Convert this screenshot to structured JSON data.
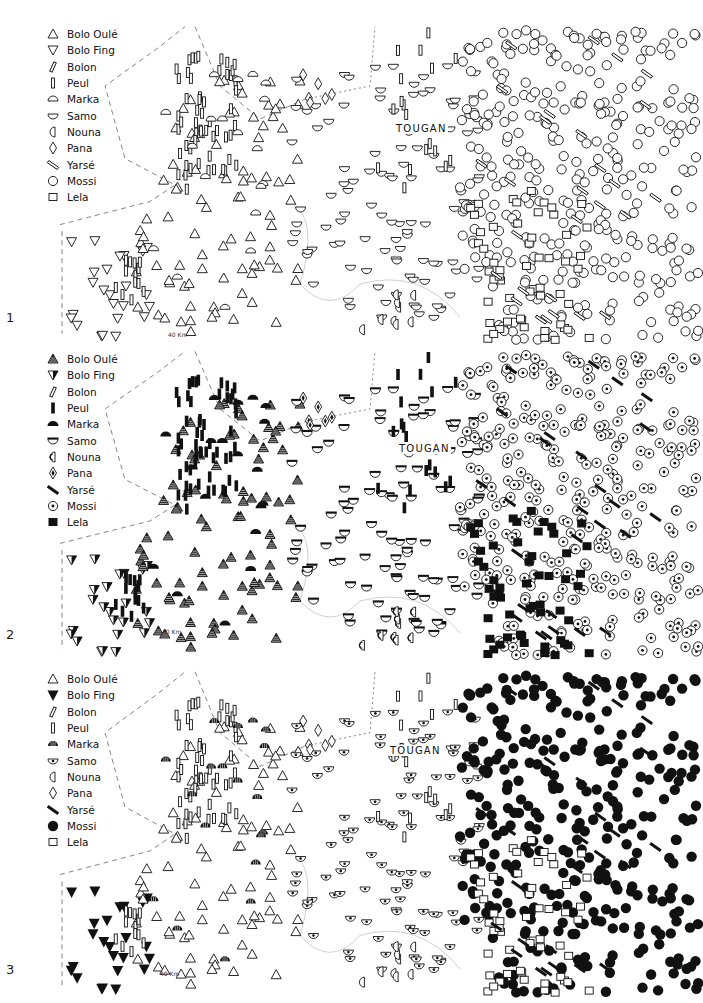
{
  "figure": {
    "panels": [
      {
        "number": "1",
        "top": 20,
        "height": 330,
        "town": {
          "name": "TOUGAN",
          "x": 395,
          "y": 103
        },
        "scale_label": "40 Km",
        "scale_pos": {
          "x": 168,
          "y": 311
        },
        "legend": [
          {
            "label": "Bolo Oulé",
            "group": "bolo_oule",
            "style": "tri-up-open"
          },
          {
            "label": "Bolo Fing",
            "group": "bolo_fing",
            "style": "tri-down-open"
          },
          {
            "label": "Bolon",
            "group": "bolon",
            "style": "slash-open"
          },
          {
            "label": "Peul",
            "group": "peul",
            "style": "bar-open"
          },
          {
            "label": "Marka",
            "group": "marka",
            "style": "dome-open"
          },
          {
            "label": "Samo",
            "group": "samo",
            "style": "bowl-open"
          },
          {
            "label": "Nouna",
            "group": "nouna",
            "style": "nouna-open"
          },
          {
            "label": "Pana",
            "group": "pana",
            "style": "diamond-open"
          },
          {
            "label": "Yarsé",
            "group": "yarse",
            "style": "yarse-open"
          },
          {
            "label": "Mossi",
            "group": "mossi",
            "style": "circle-open"
          },
          {
            "label": "Lela",
            "group": "lela",
            "style": "square-open"
          }
        ]
      },
      {
        "number": "2",
        "top": 345,
        "height": 320,
        "town": {
          "name": "TOUGAN",
          "x": 398,
          "y": 98
        },
        "scale_label": "40 Km",
        "scale_pos": {
          "x": 162,
          "y": 283
        },
        "legend": [
          {
            "label": "Bolo Oulé",
            "group": "bolo_oule",
            "style": "tri-up-hatched"
          },
          {
            "label": "Bolo Fing",
            "group": "bolo_fing",
            "style": "tri-down-half"
          },
          {
            "label": "Bolon",
            "group": "bolon",
            "style": "slash-open"
          },
          {
            "label": "Peul",
            "group": "peul",
            "style": "bar-filled"
          },
          {
            "label": "Marka",
            "group": "marka",
            "style": "dome-filled"
          },
          {
            "label": "Samo",
            "group": "samo",
            "style": "bowl-lidded"
          },
          {
            "label": "Nouna",
            "group": "nouna",
            "style": "nouna-striped"
          },
          {
            "label": "Pana",
            "group": "pana",
            "style": "diamond-dot"
          },
          {
            "label": "Yarsé",
            "group": "yarse",
            "style": "yarse-filled"
          },
          {
            "label": "Mossi",
            "group": "mossi",
            "style": "circle-dot"
          },
          {
            "label": "Lela",
            "group": "lela",
            "style": "square-filled"
          }
        ]
      },
      {
        "number": "3",
        "top": 665,
        "height": 338,
        "town": {
          "name": "TOUGAN",
          "x": 389,
          "y": 80
        },
        "scale_label": "40 Km",
        "scale_pos": {
          "x": 160,
          "y": 305
        },
        "legend": [
          {
            "label": "Bolo Oulé",
            "group": "bolo_oule",
            "style": "tri-up-open"
          },
          {
            "label": "Bolo Fing",
            "group": "bolo_fing",
            "style": "tri-down-filled"
          },
          {
            "label": "Bolon",
            "group": "bolon",
            "style": "slash-open"
          },
          {
            "label": "Peul",
            "group": "peul",
            "style": "bar-open"
          },
          {
            "label": "Marka",
            "group": "marka",
            "style": "dome-striped"
          },
          {
            "label": "Samo",
            "group": "samo",
            "style": "bowl-eye"
          },
          {
            "label": "Nouna",
            "group": "nouna",
            "style": "nouna-open"
          },
          {
            "label": "Pana",
            "group": "pana",
            "style": "diamond-open"
          },
          {
            "label": "Yarsé",
            "group": "yarse",
            "style": "yarse-filled"
          },
          {
            "label": "Mossi",
            "group": "mossi",
            "style": "circle-filled"
          },
          {
            "label": "Lela",
            "group": "lela",
            "style": "square-open"
          }
        ]
      }
    ],
    "regions": {
      "bolo_fing": {
        "x": [
          70,
          150
        ],
        "y": [
          220,
          320
        ],
        "n": 24
      },
      "bolo_oule": {
        "x": [
          120,
          300
        ],
        "y": [
          60,
          320
        ],
        "n": 95
      },
      "peul_west": {
        "x": [
          165,
          240
        ],
        "y": [
          30,
          170
        ],
        "n": 55
      },
      "peul_sw": {
        "x": [
          115,
          145
        ],
        "y": [
          240,
          290
        ],
        "n": 14
      },
      "marka": {
        "x": [
          110,
          270
        ],
        "y": [
          50,
          300
        ],
        "n": 22
      },
      "samo": {
        "x": [
          290,
          480
        ],
        "y": [
          40,
          300
        ],
        "n": 110
      },
      "pana": {
        "x": [
          300,
          335
        ],
        "y": [
          50,
          85
        ],
        "n": 6
      },
      "peul_east": {
        "x": [
          370,
          460
        ],
        "y": [
          10,
          170
        ],
        "n": 18
      },
      "mossi": {
        "x": [
          460,
          700
        ],
        "y": [
          10,
          320
        ],
        "n": 340
      },
      "lela": {
        "x": [
          470,
          590
        ],
        "y": [
          170,
          320
        ],
        "n": 55
      },
      "yarse": {
        "x": [
          480,
          660
        ],
        "y": [
          20,
          300
        ],
        "n": 28
      },
      "nouna": {
        "x": [
          360,
          420
        ],
        "y": [
          270,
          310
        ],
        "n": 9
      }
    }
  }
}
